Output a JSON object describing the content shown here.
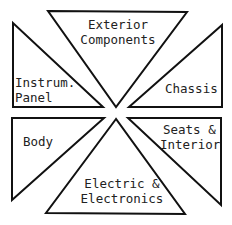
{
  "diagram": {
    "segments": [
      {
        "id": "exterior",
        "line1": "Exterior",
        "line2": "Components",
        "position": "top"
      },
      {
        "id": "instrum",
        "line1": "Instrum.",
        "line2": "Panel",
        "position": "upper-left"
      },
      {
        "id": "chassis",
        "line1": "Chassis",
        "position": "upper-right"
      },
      {
        "id": "body",
        "line1": "Body",
        "position": "lower-left"
      },
      {
        "id": "seats",
        "line1": "Seats &",
        "line2": "Interior",
        "position": "lower-right"
      },
      {
        "id": "electric",
        "line1": "Electric &",
        "line2": "Electronics",
        "position": "bottom"
      }
    ],
    "stroke_color": "#111111",
    "fill_color": "#ffffff"
  }
}
